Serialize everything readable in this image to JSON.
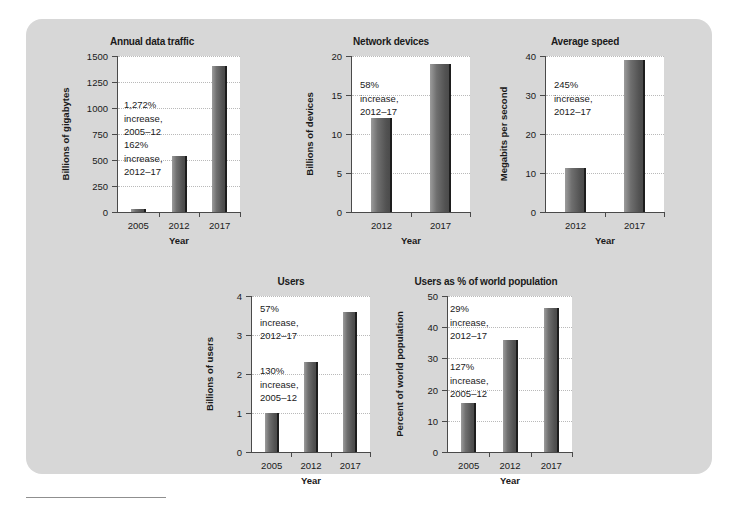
{
  "figure": {
    "panel_background": "#d7d7d7",
    "plot_background": "#ffffff",
    "bar_color": "#6f6f6f",
    "text_color": "#1a1a1a",
    "footnote_rule": ""
  },
  "chart_data": [
    {
      "id": "annual-data-traffic",
      "type": "bar",
      "title": "Annual data traffic",
      "xlabel": "Year",
      "ylabel": "Billions of gigabytes",
      "categories": [
        "2005",
        "2012",
        "2017"
      ],
      "values": [
        30,
        535,
        1400
      ],
      "ylim": [
        0,
        1500
      ],
      "yticks": [
        "0",
        "250",
        "500",
        "750",
        "1000",
        "1250",
        "1500"
      ],
      "ytick_values": [
        0,
        250,
        500,
        750,
        1000,
        1250,
        1500
      ],
      "grid": true,
      "legend": "none",
      "annotations": [
        {
          "text": "1,272%\nincrease,\n2005–12"
        },
        {
          "text": "162%\nincrease,\n2012–17"
        }
      ]
    },
    {
      "id": "network-devices",
      "type": "bar",
      "title": "Network devices",
      "xlabel": "Year",
      "ylabel": "Billions of devices",
      "categories": [
        "2012",
        "2017"
      ],
      "values": [
        12,
        19
      ],
      "ylim": [
        0,
        20
      ],
      "yticks": [
        "0",
        "5",
        "10",
        "15",
        "20"
      ],
      "ytick_values": [
        0,
        5,
        10,
        15,
        20
      ],
      "grid": true,
      "legend": "none",
      "annotations": [
        {
          "text": "58%\nincrease,\n2012–17"
        }
      ]
    },
    {
      "id": "average-speed",
      "type": "bar",
      "title": "Average speed",
      "xlabel": "Year",
      "ylabel": "Megabits per second",
      "categories": [
        "2012",
        "2017"
      ],
      "values": [
        11.3,
        39
      ],
      "ylim": [
        0,
        40
      ],
      "yticks": [
        "0",
        "10",
        "20",
        "30",
        "40"
      ],
      "ytick_values": [
        0,
        10,
        20,
        30,
        40
      ],
      "grid": true,
      "legend": "none",
      "annotations": [
        {
          "text": "245%\nincrease,\n2012–17"
        }
      ]
    },
    {
      "id": "users",
      "type": "bar",
      "title": "Users",
      "xlabel": "Year",
      "ylabel": "Billions of users",
      "categories": [
        "2005",
        "2012",
        "2017"
      ],
      "values": [
        1.0,
        2.3,
        3.6
      ],
      "ylim": [
        0,
        4
      ],
      "yticks": [
        "0",
        "1",
        "2",
        "3",
        "4"
      ],
      "ytick_values": [
        0,
        1,
        2,
        3,
        4
      ],
      "grid": true,
      "legend": "none",
      "annotations": [
        {
          "text": "130%\nincrease,\n2005–12"
        },
        {
          "text": "57%\nincrease,\n2012–17"
        }
      ]
    },
    {
      "id": "users-pct-world-population",
      "type": "bar",
      "title": "Users as % of world population",
      "xlabel": "Year",
      "ylabel": "Percent of world population",
      "categories": [
        "2005",
        "2012",
        "2017"
      ],
      "values": [
        15.8,
        36,
        46
      ],
      "ylim": [
        0,
        50
      ],
      "yticks": [
        "0",
        "10",
        "20",
        "30",
        "40",
        "50"
      ],
      "ytick_values": [
        0,
        10,
        20,
        30,
        40,
        50
      ],
      "grid": true,
      "legend": "none",
      "annotations": [
        {
          "text": "127%\nincrease,\n2005–12"
        },
        {
          "text": "29%\nincrease,\n2012–17"
        }
      ]
    }
  ]
}
